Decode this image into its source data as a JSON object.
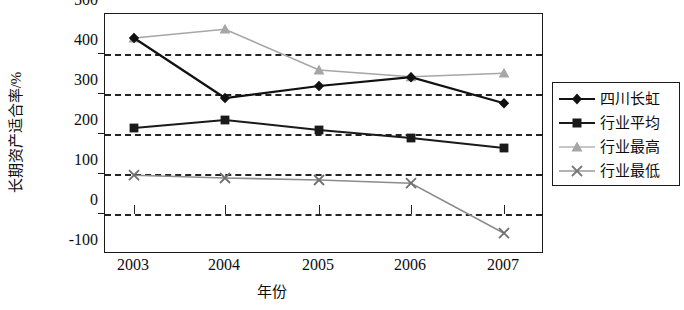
{
  "chart_data": {
    "type": "line",
    "title": "",
    "xlabel": "年份",
    "ylabel": "长期资产适合率/%",
    "categories": [
      "2003",
      "2004",
      "2005",
      "2006",
      "2007"
    ],
    "ylim": [
      -100,
      500
    ],
    "ytick_labels": [
      "500",
      "400",
      "300",
      "200",
      "100",
      "0",
      "-100"
    ],
    "ytick_values": [
      500,
      400,
      300,
      200,
      100,
      0,
      -100
    ],
    "grid": "horizontal-dashed",
    "legend_position": "right",
    "series": [
      {
        "name": "四川长虹",
        "values": [
          440,
          290,
          320,
          342,
          277
        ],
        "color": "#111111",
        "marker": "diamond"
      },
      {
        "name": "行业平均",
        "values": [
          215,
          235,
          210,
          190,
          165
        ],
        "color": "#1a1a1a",
        "marker": "square"
      },
      {
        "name": "行业最高",
        "values": [
          440,
          462,
          360,
          343,
          352
        ],
        "color": "#a6a6a6",
        "marker": "triangle"
      },
      {
        "name": "行业最低",
        "values": [
          97,
          90,
          85,
          77,
          -48
        ],
        "color": "#8c8c8c",
        "marker": "x"
      }
    ]
  },
  "axes": {
    "y_title": "长期资产适合率/%",
    "x_title": "年份",
    "y_labels": [
      "500",
      "400",
      "300",
      "200",
      "100",
      "0",
      "-100"
    ],
    "x_labels": [
      "2003",
      "2004",
      "2005",
      "2006",
      "2007"
    ]
  },
  "legend": {
    "items": [
      {
        "label": "四川长虹",
        "marker": "diamond-marker",
        "color": "#111111"
      },
      {
        "label": "行业平均",
        "marker": "square-marker",
        "color": "#1a1a1a"
      },
      {
        "label": "行业最高",
        "marker": "triangle-marker",
        "color": "#a6a6a6"
      },
      {
        "label": "行业最低",
        "marker": "x-marker",
        "color": "#8c8c8c"
      }
    ]
  }
}
